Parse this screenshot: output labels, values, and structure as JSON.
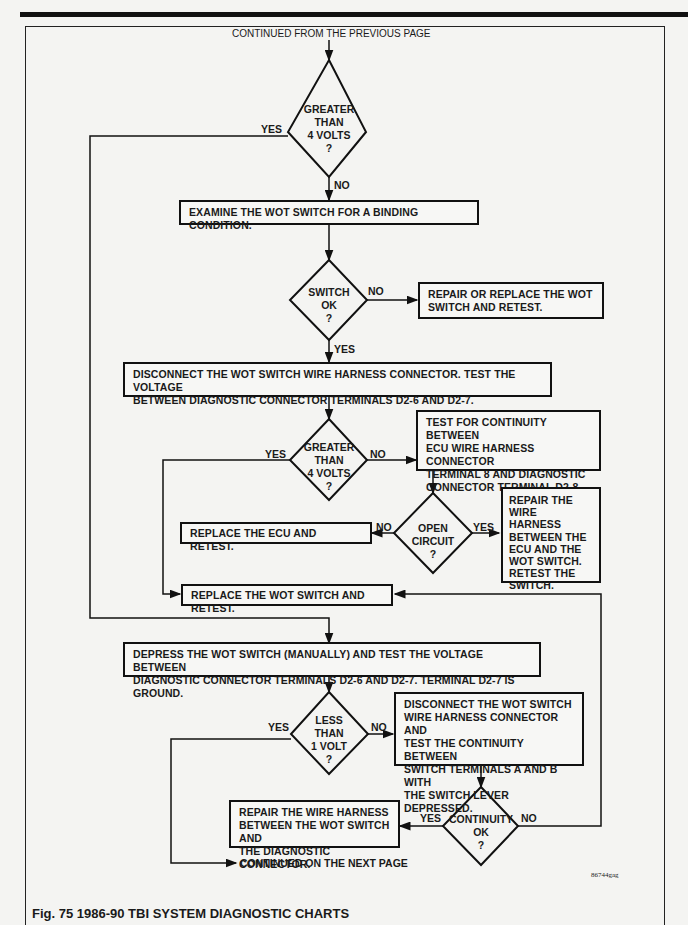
{
  "header": {
    "page_ref": "4-66 EMISSION CONTROLS"
  },
  "flow": {
    "continued_from": "CONTINUED FROM THE PREVIOUS PAGE",
    "continued_on": "CONTINUED ON THE NEXT PAGE",
    "decisions": {
      "d1": [
        "GREATER",
        "THAN",
        "4 VOLTS",
        "?"
      ],
      "d2": [
        "SWITCH",
        "OK",
        "?"
      ],
      "d3": [
        "GREATER",
        "THAN",
        "4 VOLTS",
        "?"
      ],
      "d4": [
        "OPEN",
        "CIRCUIT",
        "?"
      ],
      "d5": [
        "LESS",
        "THAN",
        "1 VOLT",
        "?"
      ],
      "d6": [
        "CONTINUITY",
        "OK",
        "?"
      ]
    },
    "boxes": {
      "examine": [
        "EXAMINE THE WOT SWITCH FOR A BINDING CONDITION."
      ],
      "repair_replace": [
        "REPAIR OR REPLACE THE WOT",
        "SWITCH AND RETEST."
      ],
      "disconnect_test": [
        "DISCONNECT THE WOT SWITCH WIRE HARNESS CONNECTOR. TEST THE VOLTAGE",
        "BETWEEN DIAGNOSTIC CONNECTOR TERMINALS D2-6 AND D2-7."
      ],
      "continuity_test": [
        "TEST FOR CONTINUITY BETWEEN",
        "ECU WIRE HARNESS CONNECTOR",
        "TERMINAL 8 AND DIAGNOSTIC",
        "CONNECTOR TERMINAL D2-8."
      ],
      "replace_ecu": [
        "REPLACE THE ECU AND RETEST."
      ],
      "repair_harness_ecu": [
        "REPAIR THE WIRE",
        "HARNESS",
        "BETWEEN THE",
        "ECU AND THE",
        "WOT SWITCH.",
        "RETEST THE",
        "SWITCH."
      ],
      "replace_wot": [
        "REPLACE THE WOT SWITCH AND RETEST."
      ],
      "depress": [
        "DEPRESS THE WOT SWITCH (MANUALLY) AND TEST THE VOLTAGE BETWEEN",
        "DIAGNOSTIC CONNECTOR TERMINALS D2-6 AND D2-7. TERMINAL D2-7 IS GROUND."
      ],
      "disconnect_continuity": [
        "DISCONNECT THE WOT SWITCH",
        "WIRE HARNESS CONNECTOR AND",
        "TEST THE CONTINUITY BETWEEN",
        "SWITCH TERMINALS A AND B WITH",
        "THE SWITCH LEVER DEPRESSED."
      ],
      "repair_harness_diag": [
        "REPAIR THE WIRE HARNESS",
        "BETWEEN THE WOT SWITCH AND",
        "THE DIAGNOSTIC CONNECTOR."
      ]
    },
    "labels": {
      "yes": "YES",
      "no": "NO"
    }
  },
  "figure": {
    "id": "86744gag",
    "caption": "Fig. 75 1986-90 TBI SYSTEM DIAGNOSTIC CHARTS"
  }
}
